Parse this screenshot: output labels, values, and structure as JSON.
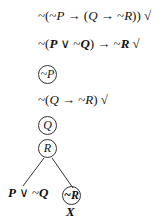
{
  "tree": {
    "premises": [
      {
        "id": "line1",
        "text": "~(~P → (Q → ~R))",
        "check": "√"
      },
      {
        "id": "line2",
        "text": "~(P ∨ ~Q) → ~R",
        "check": "√"
      }
    ],
    "derived": [
      {
        "id": "line3",
        "text": "~P",
        "circled": true
      },
      {
        "id": "line4",
        "text": "~(Q → ~R)",
        "check": "√"
      },
      {
        "id": "line5",
        "text": "Q",
        "circled": true
      },
      {
        "id": "line6",
        "text": "R",
        "circled": true
      }
    ],
    "branches": {
      "left": {
        "text": "P ∨ ~Q",
        "circled": false
      },
      "right": {
        "text": "~R",
        "circled": true,
        "closed_mark": "X"
      }
    }
  },
  "parts": {
    "l1a": "~(~",
    "l1p": "P",
    "l1b": " → (",
    "l1q": "Q",
    "l1c": " → ~",
    "l1r": "R",
    "l1d": "))",
    "l1check": " √",
    "l2a": "~(",
    "l2p": "P",
    "l2b": " ∨ ~",
    "l2q": "Q",
    "l2c": ") → ~",
    "l2r": "R",
    "l2check": " √",
    "l3": "~P",
    "l4a": "~(",
    "l4q": "Q",
    "l4b": " → ~",
    "l4r": "R",
    "l4c": ")",
    "l4check": " √",
    "l5": "Q",
    "l6": "R",
    "leftP": "P",
    "leftOr": " ∨ ~",
    "leftQ": "Q",
    "right": "~R",
    "xmark": "X"
  }
}
